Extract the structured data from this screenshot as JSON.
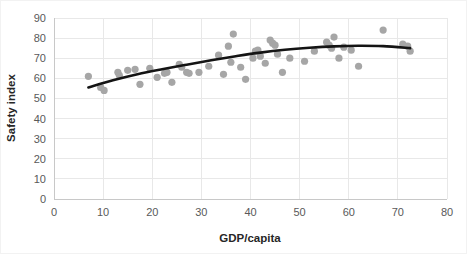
{
  "chart_data": {
    "type": "scatter",
    "title": "",
    "xlabel": "GDP/capita",
    "ylabel": "Safety index",
    "xlim": [
      0,
      80
    ],
    "ylim": [
      0,
      90
    ],
    "xticks": [
      0,
      10,
      20,
      30,
      40,
      50,
      60,
      70,
      80
    ],
    "yticks": [
      0,
      10,
      20,
      30,
      40,
      50,
      60,
      70,
      80,
      90
    ],
    "grid": true,
    "legend": "none",
    "point_color": "#a6a6a6",
    "trend_color": "#141414",
    "series": [
      {
        "name": "Countries",
        "marker": "circle",
        "points": [
          [
            7.0,
            61.0
          ],
          [
            9.5,
            55.5
          ],
          [
            10.2,
            54.0
          ],
          [
            13.0,
            63.0
          ],
          [
            13.3,
            61.5
          ],
          [
            15.0,
            64.0
          ],
          [
            16.5,
            64.5
          ],
          [
            17.5,
            57.0
          ],
          [
            19.5,
            65.0
          ],
          [
            21.0,
            60.5
          ],
          [
            22.5,
            62.5
          ],
          [
            23.0,
            63.0
          ],
          [
            24.0,
            58.0
          ],
          [
            25.5,
            67.0
          ],
          [
            26.0,
            65.5
          ],
          [
            27.0,
            63.0
          ],
          [
            27.5,
            62.5
          ],
          [
            29.5,
            63.0
          ],
          [
            31.5,
            66.0
          ],
          [
            33.5,
            71.5
          ],
          [
            34.5,
            62.0
          ],
          [
            35.5,
            76.0
          ],
          [
            36.0,
            68.0
          ],
          [
            36.5,
            82.0
          ],
          [
            38.0,
            65.5
          ],
          [
            39.0,
            59.5
          ],
          [
            40.5,
            70.0
          ],
          [
            41.0,
            73.5
          ],
          [
            41.5,
            74.0
          ],
          [
            42.0,
            71.0
          ],
          [
            43.0,
            67.5
          ],
          [
            44.0,
            79.0
          ],
          [
            44.5,
            77.5
          ],
          [
            45.0,
            76.5
          ],
          [
            45.5,
            72.0
          ],
          [
            46.5,
            63.0
          ],
          [
            48.0,
            70.0
          ],
          [
            51.0,
            68.5
          ],
          [
            53.0,
            73.5
          ],
          [
            55.5,
            78.0
          ],
          [
            56.0,
            76.5
          ],
          [
            56.5,
            75.0
          ],
          [
            57.0,
            80.5
          ],
          [
            58.0,
            70.0
          ],
          [
            59.0,
            75.5
          ],
          [
            60.5,
            74.0
          ],
          [
            62.0,
            66.0
          ],
          [
            67.0,
            84.0
          ],
          [
            71.0,
            77.0
          ],
          [
            72.0,
            76.0
          ],
          [
            72.5,
            73.5
          ]
        ]
      }
    ],
    "trendline": {
      "type": "polynomial",
      "description": "2nd order polynomial fit",
      "points": [
        [
          7.0,
          55.5
        ],
        [
          12.0,
          59.0
        ],
        [
          17.0,
          62.0
        ],
        [
          22.0,
          64.5
        ],
        [
          27.0,
          66.8
        ],
        [
          32.0,
          69.0
        ],
        [
          37.0,
          71.0
        ],
        [
          42.0,
          72.8
        ],
        [
          47.0,
          74.2
        ],
        [
          52.0,
          75.2
        ],
        [
          57.0,
          75.9
        ],
        [
          62.0,
          76.2
        ],
        [
          67.0,
          76.0
        ],
        [
          72.5,
          75.0
        ]
      ]
    }
  }
}
